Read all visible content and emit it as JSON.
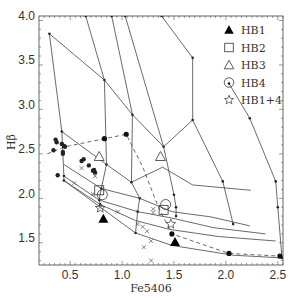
{
  "chart_data": {
    "type": "scatter",
    "title": "",
    "xlabel": "Fe5406",
    "ylabel": "Hβ",
    "xlim": [
      0.2,
      2.55
    ],
    "ylim": [
      1.2,
      4.0
    ],
    "xticks": [
      0.5,
      1.0,
      1.5,
      2.0,
      2.5
    ],
    "yticks": [
      1.5,
      2.0,
      2.5,
      3.0,
      3.5,
      4.0
    ],
    "xtick_labels": [
      "0.5",
      "1.0",
      "1.5",
      "2.0",
      "2.5"
    ],
    "ytick_labels": [
      "1.5",
      "2.0",
      "2.5",
      "3.0",
      "3.5",
      "4.0"
    ],
    "grid": false,
    "legend_position": "upper right",
    "model_grid": {
      "age_lines": [
        [
          [
            0.3,
            3.8
          ],
          [
            0.42,
            2.7
          ],
          [
            0.44,
            2.2
          ],
          [
            0.44,
            2.15
          ]
        ],
        [
          [
            0.65,
            4.0
          ],
          [
            0.83,
            3.28
          ],
          [
            0.85,
            2.33
          ],
          [
            0.8,
            2.06
          ],
          [
            0.78,
            1.93
          ],
          [
            0.79,
            1.88
          ]
        ],
        [
          [
            0.9,
            4.0
          ],
          [
            1.1,
            2.89
          ],
          [
            1.09,
            2.13
          ],
          [
            1.17,
            1.95
          ],
          [
            1.15,
            1.8
          ],
          [
            1.13,
            1.56
          ]
        ],
        [
          [
            1.03,
            4.0
          ],
          [
            1.4,
            2.53
          ],
          [
            1.5,
            1.99
          ],
          [
            1.52,
            1.85
          ],
          [
            1.52,
            1.75
          ]
        ],
        [
          [
            1.38,
            4.0
          ],
          [
            1.68,
            3.53
          ],
          [
            1.68,
            2.83
          ],
          [
            1.97,
            2.14
          ],
          [
            2.07,
            1.66
          ]
        ],
        [
          [
            2.03,
            3.24
          ],
          [
            2.23,
            2.85
          ],
          [
            2.48,
            2.14
          ],
          [
            2.5,
            1.85
          ],
          [
            2.54,
            1.28
          ]
        ]
      ],
      "metallicity_lines": [
        [
          [
            0.3,
            3.8
          ],
          [
            0.83,
            3.28
          ],
          [
            1.1,
            2.89
          ],
          [
            1.4,
            2.53
          ],
          [
            1.68,
            2.83
          ]
        ],
        [
          [
            0.42,
            2.7
          ],
          [
            0.85,
            2.33
          ],
          [
            1.09,
            2.13
          ],
          [
            1.39,
            2.3
          ],
          [
            1.68,
            2.1
          ],
          [
            2.24,
            2.04
          ]
        ],
        [
          [
            0.44,
            2.33
          ],
          [
            0.8,
            2.06
          ],
          [
            1.17,
            1.95
          ],
          [
            1.48,
            1.8
          ],
          [
            1.86,
            1.74
          ],
          [
            2.23,
            1.64
          ]
        ],
        [
          [
            0.44,
            2.2
          ],
          [
            0.78,
            1.93
          ],
          [
            1.15,
            1.8
          ],
          [
            1.47,
            1.73
          ],
          [
            1.88,
            1.62
          ],
          [
            2.38,
            1.55
          ]
        ],
        [
          [
            0.44,
            2.15
          ],
          [
            0.79,
            1.88
          ],
          [
            1.13,
            1.7
          ],
          [
            1.46,
            1.6
          ],
          [
            1.93,
            1.52
          ],
          [
            2.48,
            1.47
          ]
        ],
        [
          [
            0.44,
            2.15
          ],
          [
            1.13,
            1.56
          ],
          [
            1.48,
            1.42
          ],
          [
            2.07,
            1.31
          ],
          [
            2.54,
            1.28
          ]
        ]
      ],
      "dashed_track": [
        [
          0.28,
          2.45
        ],
        [
          0.45,
          2.53
        ],
        [
          0.83,
          2.62
        ],
        [
          1.04,
          2.67
        ],
        [
          1.2,
          2.3
        ],
        [
          1.35,
          1.85
        ],
        [
          1.48,
          1.55
        ],
        [
          2.03,
          1.33
        ],
        [
          2.52,
          1.3
        ]
      ]
    },
    "series": [
      {
        "name": "HB1",
        "marker": "filled-triangle",
        "points": [
          [
            0.82,
            1.72
          ],
          [
            1.51,
            1.46
          ]
        ]
      },
      {
        "name": "HB2",
        "marker": "open-square",
        "points": [
          [
            0.78,
            2.04
          ],
          [
            1.4,
            1.82
          ]
        ]
      },
      {
        "name": "HB3",
        "marker": "open-triangle",
        "points": [
          [
            0.78,
            2.42
          ],
          [
            1.37,
            2.42
          ]
        ]
      },
      {
        "name": "HB4",
        "marker": "open-circle",
        "points": [
          [
            0.81,
            1.99
          ],
          [
            1.42,
            1.88
          ]
        ]
      },
      {
        "name": "HB1+4",
        "marker": "open-star",
        "points": [
          [
            0.79,
            1.84
          ],
          [
            1.47,
            1.66
          ]
        ]
      },
      {
        "name": "observed (filled dots)",
        "marker": "filled-dot",
        "points": [
          [
            0.36,
            2.61
          ],
          [
            0.37,
            2.58
          ],
          [
            0.34,
            2.49
          ],
          [
            0.42,
            2.56
          ],
          [
            0.44,
            2.54
          ],
          [
            0.45,
            2.53
          ],
          [
            0.43,
            2.45
          ],
          [
            0.38,
            2.21
          ],
          [
            0.61,
            2.37
          ],
          [
            0.63,
            2.39
          ],
          [
            0.68,
            2.32
          ],
          [
            0.72,
            2.26
          ],
          [
            0.73,
            2.27
          ],
          [
            0.74,
            2.24
          ],
          [
            0.43,
            2.47
          ]
        ]
      },
      {
        "name": "observed (crosses)",
        "marker": "cross",
        "points": [
          [
            0.61,
            2.29
          ],
          [
            0.74,
            2.2
          ],
          [
            0.54,
            2.12
          ],
          [
            0.72,
            2.0
          ],
          [
            0.79,
            1.85
          ],
          [
            0.96,
            1.8
          ],
          [
            1.2,
            1.63
          ],
          [
            1.24,
            1.58
          ],
          [
            1.15,
            1.66
          ],
          [
            1.28,
            1.47
          ],
          [
            1.3,
            1.83
          ],
          [
            1.3,
            1.79
          ],
          [
            1.21,
            1.4
          ],
          [
            1.28,
            1.25
          ]
        ]
      }
    ]
  },
  "legend": {
    "items": [
      {
        "label": "HB1",
        "marker": "filled-triangle"
      },
      {
        "label": "HB2",
        "marker": "open-square"
      },
      {
        "label": "HB3",
        "marker": "open-triangle"
      },
      {
        "label": "HB4",
        "marker": "open-circle"
      },
      {
        "label": "HB1+4",
        "marker": "open-star"
      }
    ]
  },
  "axes": {
    "xlabel": "Fe5406",
    "ylabel": "Hβ",
    "xticks": [
      "0.5",
      "1.0",
      "1.5",
      "2.0",
      "2.5"
    ],
    "yticks": [
      "1.5",
      "2.0",
      "2.5",
      "3.0",
      "3.5",
      "4.0"
    ]
  }
}
